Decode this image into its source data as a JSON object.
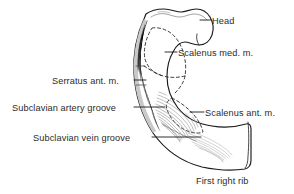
{
  "figure": {
    "kind": "anatomical-line-drawing",
    "background_color": "#ffffff",
    "ink_color": "#1a1a1a",
    "text_color": "#2b2b2b",
    "shading_color": "#9a9a9a",
    "width": 294,
    "height": 194
  },
  "labels": {
    "head": "Head",
    "scalenus_med": "Scalenus med. m.",
    "serratus_ant": "Serratus ant. m.",
    "subclavian_artery_groove": "Subclavian artery groove",
    "scalenus_ant": "Scalenus ant. m.",
    "subclavian_vein_groove": "Subclavian vein groove",
    "first_right_rib": "First right rib"
  },
  "annotation_list": [
    {
      "id": "head",
      "text": "Head",
      "side": "right",
      "has_leader": true
    },
    {
      "id": "scalenus-med",
      "text": "Scalenus med. m.",
      "side": "right",
      "has_leader": true
    },
    {
      "id": "serratus-ant",
      "text": "Serratus ant. m.",
      "side": "left",
      "has_leader": true
    },
    {
      "id": "subclavian-artery-groove",
      "text": "Subclavian artery groove",
      "side": "left",
      "has_leader": true
    },
    {
      "id": "scalenus-ant",
      "text": "Scalenus ant. m.",
      "side": "right",
      "has_leader": true
    },
    {
      "id": "subclavian-vein-groove",
      "text": "Subclavian vein groove",
      "side": "left",
      "has_leader": true
    },
    {
      "id": "first-right-rib",
      "text": "First right rib",
      "side": "bottom",
      "has_leader": false
    }
  ]
}
